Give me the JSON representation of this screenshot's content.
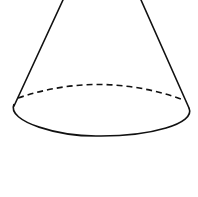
{
  "diagram": {
    "shape": "cone",
    "stroke_color": "#111111",
    "background": "#ffffff",
    "base_ellipse": {
      "cx": 101,
      "cy": 110,
      "rx": 88,
      "ry": 26
    },
    "apex_lines": {
      "left": {
        "x1": 63,
        "y1": 0,
        "x2": 14,
        "y2": 106
      },
      "right": {
        "x1": 141,
        "y1": 0,
        "x2": 189,
        "y2": 108
      }
    }
  }
}
